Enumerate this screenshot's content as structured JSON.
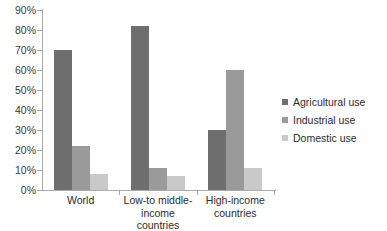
{
  "chart_data": {
    "type": "bar",
    "title": "",
    "xlabel": "",
    "ylabel": "",
    "categories": [
      "World",
      "Low-to middle-income countries",
      "High-income countries"
    ],
    "category_lines": [
      [
        "World"
      ],
      [
        "Low-to middle-",
        "income countries"
      ],
      [
        "High-income",
        "countries"
      ]
    ],
    "series": [
      {
        "name": "Agricultural use",
        "values": [
          70,
          82,
          30
        ],
        "color": "#6e6e6e"
      },
      {
        "name": "Industrial use",
        "values": [
          22,
          11,
          60
        ],
        "color": "#9a9a9a"
      },
      {
        "name": "Domestic use",
        "values": [
          8,
          7,
          11
        ],
        "color": "#c9c9c9"
      }
    ],
    "ylim": [
      0,
      90
    ],
    "ytick_step": 10,
    "ytick_labels": [
      "0%",
      "10%",
      "20%",
      "30%",
      "40%",
      "50%",
      "60%",
      "70%",
      "80%",
      "90%"
    ],
    "ytick_values": [
      0,
      10,
      20,
      30,
      40,
      50,
      60,
      70,
      80,
      90
    ],
    "grid": false,
    "legend_position": "right"
  },
  "legend": {
    "items": [
      {
        "label": "Agricultural use"
      },
      {
        "label": "Industrial use"
      },
      {
        "label": "Domestic use"
      }
    ]
  }
}
